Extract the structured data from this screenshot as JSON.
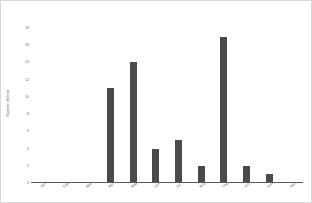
{
  "chart_data": {
    "type": "bar",
    "title": "",
    "subtitle": "",
    "xlabel": "",
    "ylabel": "Number of birds",
    "categories": [
      "Jan",
      "Feb",
      "Mar",
      "Apr",
      "May",
      "Jun",
      "Jul",
      "Aug",
      "Sep",
      "Oct",
      "Nov",
      "Dec"
    ],
    "values": [
      0,
      0,
      0,
      11,
      14,
      4,
      5,
      2,
      17,
      2,
      1,
      0
    ],
    "ylim": [
      0,
      18
    ],
    "ytick_values": [
      0,
      2,
      4,
      6,
      8,
      10,
      12,
      14,
      16,
      18
    ],
    "ytick_labels": [
      "0",
      "2",
      "4",
      "6",
      "8",
      "10",
      "12",
      "14",
      "16",
      "18"
    ],
    "grid": false,
    "legend": false,
    "legend_position": "none",
    "bar_color": "#4a4a4a",
    "background_color": "#ffffff",
    "border_color": "#d8d8d8",
    "axis_color": "#5a5a5a",
    "tick_label_color": "#6a6a6a",
    "xtick_rotation": -45
  }
}
